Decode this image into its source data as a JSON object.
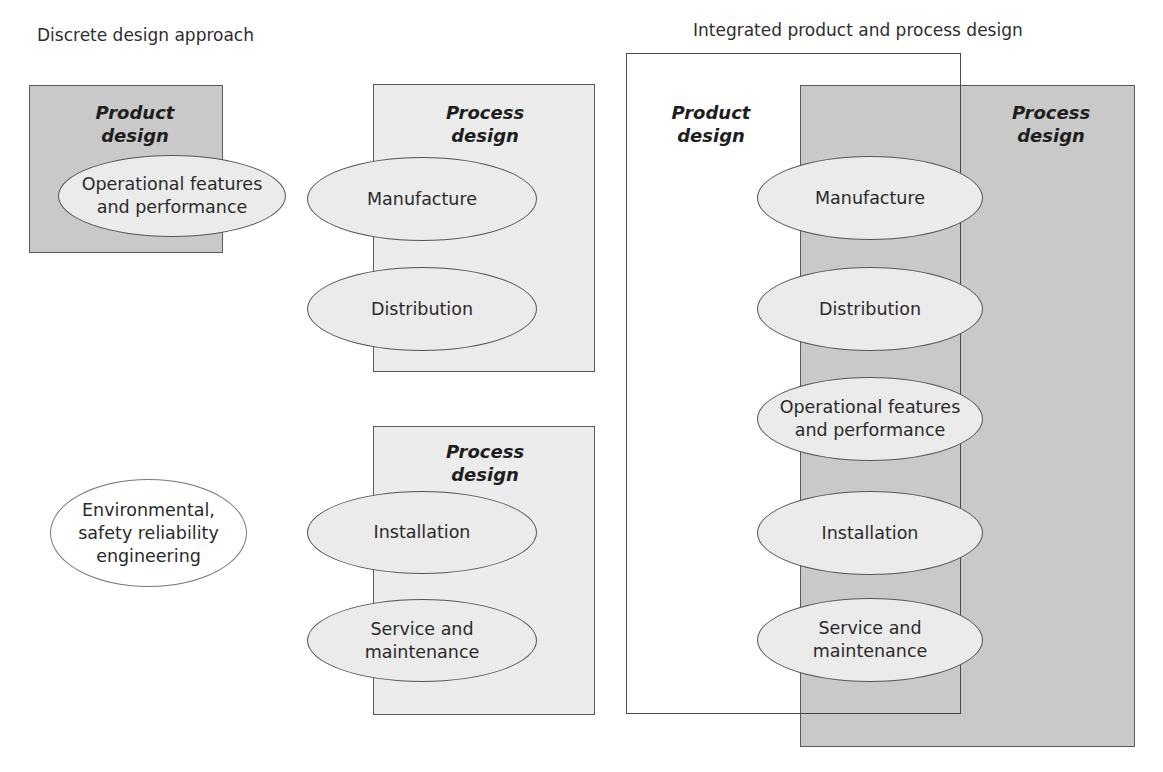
{
  "discrete": {
    "heading": "Discrete design approach",
    "product_box": {
      "label": "Product\ndesign",
      "ellipse": "Operational features\nand performance"
    },
    "process_box_1": {
      "label": "Process\ndesign",
      "ellipses": [
        "Manufacture",
        "Distribution"
      ]
    },
    "process_box_2": {
      "label": "Process\ndesign",
      "ellipses": [
        "Installation",
        "Service and\nmaintenance"
      ]
    },
    "standalone_ellipse": "Environmental,\nsafety reliability\nengineering"
  },
  "integrated": {
    "heading": "Integrated product and process design",
    "product_label": "Product\ndesign",
    "process_label": "Process\ndesign",
    "ellipses": [
      "Manufacture",
      "Distribution",
      "Operational features\nand performance",
      "Installation",
      "Service and\nmaintenance"
    ]
  },
  "colors": {
    "dark_box": "#c9c9c9",
    "light_box": "#ececec",
    "ellipse_fill": "#ebebeb",
    "border": "#5a5a5a"
  }
}
